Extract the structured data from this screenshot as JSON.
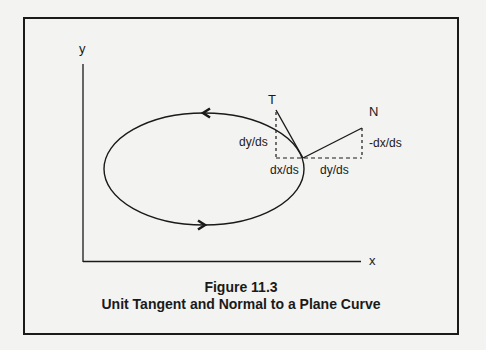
{
  "figure": {
    "number_label": "Figure 11.3",
    "title": "Unit Tangent and Normal to a Plane Curve"
  },
  "axes": {
    "x_label": "x",
    "y_label": "y"
  },
  "vectors": {
    "tangent_label": "T",
    "normal_label": "N"
  },
  "components": {
    "tangent_vertical": "dy/ds",
    "tangent_horizontal": "dx/ds",
    "normal_horizontal": "dy/ds",
    "normal_vertical": "-dx/ds"
  },
  "colors": {
    "ink": "#1a1a1a",
    "background": "#f3f3f1"
  }
}
